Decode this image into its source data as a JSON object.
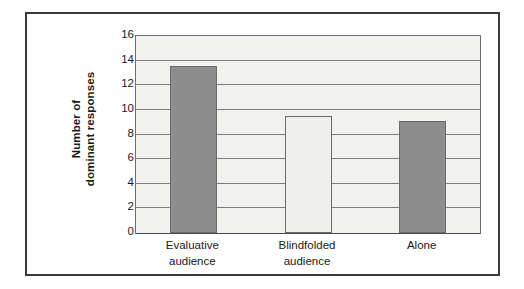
{
  "chart_data": {
    "type": "bar",
    "title": "",
    "subtitle": "",
    "xlabel": "",
    "ylabel": "Number of dominant responses",
    "ylabel_lines": [
      "Number of",
      "dominant responses"
    ],
    "categories": [
      "Evaluative audience",
      "Blindfolded audience",
      "Alone"
    ],
    "category_lines": [
      [
        "Evaluative",
        "audience"
      ],
      [
        "Blindfolded",
        "audience"
      ],
      [
        "Alone"
      ]
    ],
    "values": [
      13.6,
      9.5,
      9.1
    ],
    "ylim": [
      0,
      16
    ],
    "ytick_labels": [
      "0",
      "2",
      "4",
      "6",
      "8",
      "10",
      "12",
      "14",
      "16"
    ],
    "ytick_values": [
      0,
      2,
      4,
      6,
      8,
      10,
      12,
      14,
      16
    ],
    "grid": true,
    "legend": "none",
    "bar_colors": [
      "#8d8d8d",
      "#efefec",
      "#8d8d8d"
    ],
    "bar_border_color": "#6b6b6b",
    "plot_background": "#f1f1ef",
    "gridline_color": "#7d7d7d",
    "frame_color": "#3b3b3b",
    "text_color": "#1a1a1a"
  }
}
